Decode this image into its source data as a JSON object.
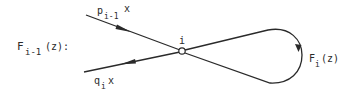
{
  "diagram": {
    "graph_label": {
      "main": "F",
      "sub": "i-1",
      "suffix": "(z):"
    },
    "node": {
      "label": "i"
    },
    "incoming_edge": {
      "main": "p",
      "sub": "i-1",
      "suffix": "x"
    },
    "outgoing_edge": {
      "main": "q",
      "sub": "i",
      "suffix": "x"
    },
    "loop": {
      "main": "F",
      "sub": "i",
      "suffix": "(z)"
    }
  },
  "colors": {
    "stroke": "#2a2a2a",
    "background": "#ffffff"
  }
}
